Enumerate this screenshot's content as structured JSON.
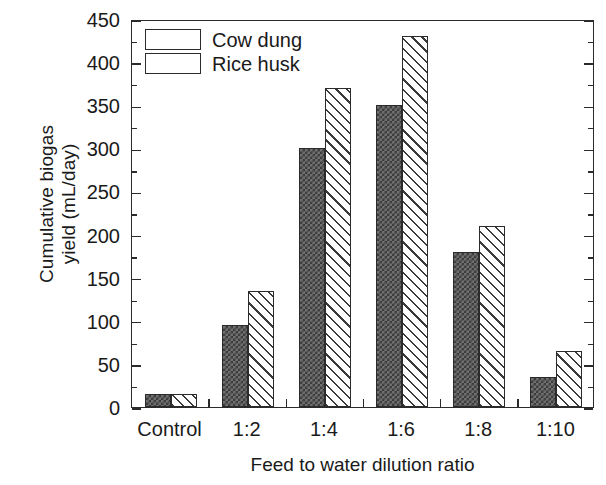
{
  "chart_data": {
    "type": "bar",
    "title": "",
    "subtitle": "",
    "xlabel": "Feed to water dilution ratio",
    "ylabel": "Cumulative biogas yield (mL/day)",
    "ylabel_lines": [
      "Cumulative biogas",
      "yield (mL/day)"
    ],
    "categories": [
      "Control",
      "1:2",
      "1:4",
      "1:6",
      "1:8",
      "1:10"
    ],
    "series": [
      {
        "name": "Cow dung",
        "values": [
          15,
          95,
          300,
          350,
          180,
          35
        ],
        "pattern": "dotted-dark-fill",
        "color": "#6f6f6f"
      },
      {
        "name": "Rice husk",
        "values": [
          15,
          135,
          370,
          430,
          210,
          65
        ],
        "pattern": "diagonal-hatch",
        "color": "#ffffff"
      }
    ],
    "ylim": [
      0,
      450
    ],
    "ytick_major": [
      0,
      50,
      100,
      150,
      200,
      250,
      300,
      350,
      400,
      450
    ],
    "ytick_minor_step": 25,
    "ytick_labels": [
      "450",
      "400",
      "350",
      "300",
      "250",
      "200",
      "150",
      "100",
      "50",
      "0"
    ],
    "grid": false,
    "legend_position": "top-left",
    "axis_color": "#2b2b2b",
    "frame": "box-all-sides",
    "tick_direction": "in"
  },
  "legend": {
    "entries": [
      {
        "label": "Cow dung"
      },
      {
        "label": "Rice husk"
      }
    ]
  }
}
